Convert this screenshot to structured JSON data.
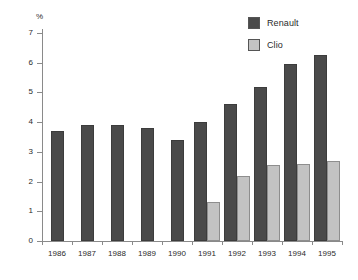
{
  "chart_data": {
    "type": "bar",
    "title": "",
    "subtitle": "",
    "xlabel": "",
    "ylabel": "%",
    "ylim": [
      0,
      7
    ],
    "yticks": [
      0,
      1,
      2,
      3,
      4,
      5,
      6,
      7
    ],
    "ytick_labels": [
      "0",
      "1",
      "2",
      "3",
      "4",
      "5",
      "6",
      "7"
    ],
    "grid": false,
    "legend_position": "top-right",
    "categories": [
      "1986",
      "1987",
      "1988",
      "1989",
      "1990",
      "1991",
      "1992",
      "1993",
      "1994",
      "1995"
    ],
    "series": [
      {
        "name": "Renault",
        "color": "#4a4a4a",
        "values": [
          3.7,
          3.9,
          3.9,
          3.8,
          3.4,
          4.0,
          4.6,
          5.2,
          5.95,
          6.25
        ]
      },
      {
        "name": "Clio",
        "color": "#c3c3c3",
        "values": [
          null,
          null,
          null,
          null,
          null,
          1.3,
          2.2,
          2.55,
          2.6,
          2.7
        ]
      }
    ]
  },
  "legend": {
    "items": [
      {
        "label": "Renault",
        "color": "#4a4a4a"
      },
      {
        "label": "Clio",
        "color": "#c3c3c3"
      }
    ]
  },
  "axes": {
    "unit_label": "%"
  }
}
